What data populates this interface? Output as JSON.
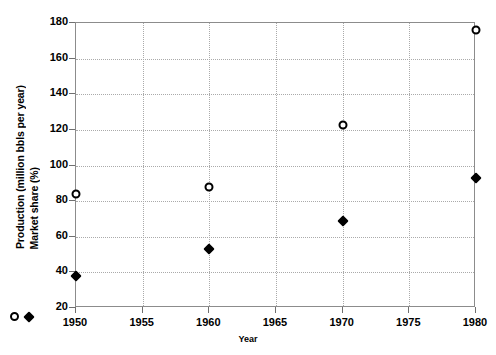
{
  "chart_data": {
    "type": "scatter",
    "title": "",
    "xlabel": "Year",
    "ylabel": "Production (million bbls per year) / Market share (%)",
    "x": [
      1950,
      1960,
      1970,
      1980
    ],
    "xlim": [
      1950,
      1980
    ],
    "ylim": [
      20,
      180
    ],
    "xticks": [
      "1950",
      "1955",
      "1960",
      "1965",
      "1970",
      "1975",
      "1980"
    ],
    "yticks": [
      "20",
      "40",
      "60",
      "80",
      "100",
      "120",
      "140",
      "160",
      "180"
    ],
    "grid": true,
    "legend_position": "y-axis-inline",
    "series": [
      {
        "name": "Production (million bbls per year)",
        "marker": "open-circle",
        "color": "#000000",
        "values": [
          84,
          88,
          123,
          176
        ]
      },
      {
        "name": "Market share (%)",
        "marker": "filled-diamond",
        "color": "#000000",
        "values": [
          38,
          53,
          69,
          93
        ]
      }
    ]
  },
  "axes": {
    "y_title_production": "Production (million bbls per year)",
    "y_title_market_share": "Market share (%)",
    "x_title": "Year"
  },
  "icons": {
    "open_circle": "open-circle-marker",
    "filled_diamond": "filled-diamond-marker"
  }
}
